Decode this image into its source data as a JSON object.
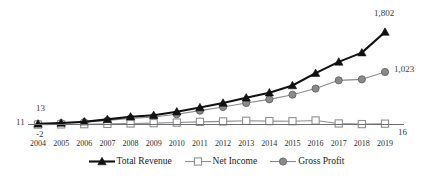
{
  "chart_data": {
    "type": "line",
    "title": "",
    "subtitle": "",
    "xlabel": "",
    "ylabel": "",
    "grid": false,
    "legend_position": "bottom-center",
    "x": [
      "2004",
      "2005",
      "2006",
      "2007",
      "2008",
      "2009",
      "2010",
      "2011",
      "2012",
      "2013",
      "2014",
      "2015",
      "2016",
      "2017",
      "2018",
      "2019"
    ],
    "categories": [
      "2004",
      "2005",
      "2006",
      "2007",
      "2008",
      "2009",
      "2010",
      "2011",
      "2012",
      "2013",
      "2014",
      "2015",
      "2016",
      "2017",
      "2018",
      "2019"
    ],
    "ylim": [
      -60,
      1900
    ],
    "series": [
      {
        "name": "Total Revenue",
        "color": "#111111",
        "marker": "triangle",
        "values": [
          13,
          30,
          55,
          100,
          150,
          180,
          250,
          330,
          420,
          520,
          620,
          760,
          1000,
          1220,
          1400,
          1802
        ],
        "endpoint_label": "1,802",
        "start_label": "13"
      },
      {
        "name": "Net Income",
        "color": "#8f8f8f",
        "marker": "square-open",
        "values": [
          -2,
          2,
          6,
          12,
          20,
          26,
          38,
          52,
          60,
          72,
          66,
          64,
          78,
          20,
          8,
          16
        ],
        "endpoint_label": "16",
        "start_label": "-2"
      },
      {
        "name": "Gross Profit",
        "color": "#8a8a8a",
        "marker": "circle",
        "values": [
          11,
          25,
          45,
          80,
          120,
          145,
          200,
          270,
          340,
          420,
          490,
          580,
          700,
          860,
          880,
          1023
        ],
        "endpoint_label": "1,023",
        "start_label": "11"
      }
    ],
    "annotations": [
      {
        "text": "13",
        "series": "Total Revenue",
        "position": "above-first-point"
      },
      {
        "text": "11",
        "series": "Gross Profit",
        "position": "left-of-first-point"
      },
      {
        "text": "-2",
        "series": "Net Income",
        "position": "below-first-point"
      },
      {
        "text": "1,802",
        "series": "Total Revenue",
        "position": "above-last-point"
      },
      {
        "text": "1,023",
        "series": "Gross Profit",
        "position": "right-of-last-point"
      },
      {
        "text": "16",
        "series": "Net Income",
        "position": "right-of-last-point"
      }
    ]
  },
  "axis": {
    "tick_labels": [
      "2004",
      "2005",
      "2006",
      "2007",
      "2008",
      "2009",
      "2010",
      "2011",
      "2012",
      "2013",
      "2014",
      "2015",
      "2016",
      "2017",
      "2018",
      "2019"
    ],
    "axis_color": "#6f6f6f"
  },
  "legend": {
    "items": [
      {
        "label": "Total Revenue",
        "marker": "triangle",
        "color": "#111111"
      },
      {
        "label": "Net Income",
        "marker": "square-open",
        "color": "#8f8f8f"
      },
      {
        "label": "Gross Profit",
        "marker": "circle",
        "color": "#8a8a8a"
      }
    ]
  },
  "point_labels": {
    "first_total_revenue": "13",
    "first_gross_profit": "11",
    "first_net_income": "-2",
    "last_total_revenue": "1,802",
    "last_gross_profit": "1,023",
    "last_net_income": "16"
  },
  "colors": {
    "total_revenue": "#111111",
    "net_income": "#8f8f8f",
    "gross_profit": "#8a8a8a",
    "axis": "#6f6f6f",
    "background": "#ffffff",
    "label_text": "#3a3a3a"
  }
}
